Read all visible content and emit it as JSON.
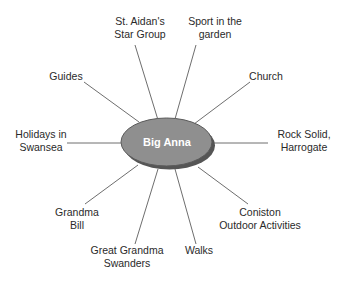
{
  "center": {
    "label": "Big Anna",
    "fill": "#8f8f8f",
    "shadow": "#555555"
  },
  "spokes": [
    {
      "id": "st-aidans",
      "label_line1": "St. Aidan's",
      "label_line2": "Star Group"
    },
    {
      "id": "sport",
      "label_line1": "Sport in the",
      "label_line2": "garden"
    },
    {
      "id": "church",
      "label_line1": "Church",
      "label_line2": ""
    },
    {
      "id": "rock-solid",
      "label_line1": "Rock Solid,",
      "label_line2": "Harrogate"
    },
    {
      "id": "coniston",
      "label_line1": "Coniston",
      "label_line2": "Outdoor Activities"
    },
    {
      "id": "walks",
      "label_line1": "Walks",
      "label_line2": ""
    },
    {
      "id": "great-grandma",
      "label_line1": "Great Grandma",
      "label_line2": "Swanders"
    },
    {
      "id": "grandma-bill",
      "label_line1": "Grandma",
      "label_line2": "Bill"
    },
    {
      "id": "holidays",
      "label_line1": "Holidays in",
      "label_line2": "Swansea"
    },
    {
      "id": "guides",
      "label_line1": "Guides",
      "label_line2": ""
    }
  ]
}
